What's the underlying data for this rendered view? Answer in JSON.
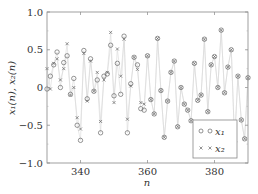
{
  "chart_data": {
    "type": "scatter",
    "title": "",
    "xlabel": "n",
    "ylabel": "x_1(n), x_2(n)",
    "xlim": [
      330,
      390
    ],
    "ylim": [
      -1.0,
      1.0
    ],
    "xticks": [
      340,
      360,
      380
    ],
    "xtick_labels": [
      "340",
      "360",
      "380"
    ],
    "yticks": [
      -1.0,
      -0.5,
      0,
      0.5,
      1.0
    ],
    "ytick_labels": [
      "−1.0",
      "−0.5",
      "0",
      "0.5",
      "1.0"
    ],
    "grid": false,
    "legend_position": "lower right",
    "connecting_lines": true,
    "x": [
      330,
      331,
      332,
      333,
      334,
      335,
      336,
      337,
      338,
      339,
      340,
      341,
      342,
      343,
      344,
      345,
      346,
      347,
      348,
      349,
      350,
      351,
      352,
      353,
      354,
      355,
      356,
      357,
      358,
      359,
      360,
      361,
      362,
      363,
      364,
      365,
      366,
      367,
      368,
      369,
      370,
      371,
      372,
      373,
      374,
      375,
      376,
      377,
      378,
      379,
      380,
      381,
      382,
      383,
      384,
      385,
      386,
      387,
      388,
      389,
      390
    ],
    "series": [
      {
        "name": "x_1",
        "marker": "circle",
        "values": [
          -0.02,
          0.15,
          0.3,
          0.47,
          0.0,
          0.33,
          0.42,
          -0.09,
          0.12,
          -0.5,
          -0.7,
          0.49,
          -0.15,
          0.38,
          -0.05,
          0.1,
          -0.6,
          0.15,
          0.18,
          0.56,
          -0.11,
          0.32,
          -0.09,
          0.68,
          -0.6,
          0.05,
          0.4,
          0.3,
          -0.28,
          -0.3,
          0.42,
          -0.16,
          -0.35,
          0.65,
          -0.04,
          -0.66,
          -0.18,
          0.2,
          0.35,
          -0.52,
          0.0,
          -0.22,
          -0.3,
          -0.44,
          0.32,
          -0.17,
          -0.1,
          0.64,
          -0.32,
          0.3,
          0.41,
          0.0,
          0.76,
          -0.07,
          0.27,
          0.5,
          -0.72,
          0.15,
          -0.43,
          -0.68,
          0.13
        ]
      },
      {
        "name": "x_2",
        "marker": "cross",
        "values": [
          0.25,
          -0.02,
          0.32,
          0.38,
          0.1,
          0.25,
          0.58,
          -0.1,
          0.0,
          -0.4,
          -0.55,
          0.45,
          -0.18,
          0.35,
          -0.05,
          0.2,
          -0.45,
          0.1,
          0.2,
          0.73,
          -0.2,
          0.51,
          0.15,
          0.64,
          -0.42,
          0.02,
          0.4,
          0.24,
          -0.2,
          -0.22,
          0.42,
          -0.16,
          -0.35,
          0.65,
          -0.04,
          -0.66,
          -0.18,
          0.2,
          0.35,
          -0.52,
          0.0,
          -0.22,
          -0.3,
          -0.44,
          0.32,
          -0.17,
          -0.1,
          0.64,
          -0.32,
          0.3,
          0.41,
          0.0,
          0.76,
          -0.07,
          0.27,
          0.5,
          -0.72,
          0.15,
          -0.43,
          -0.68,
          0.13
        ]
      }
    ],
    "legend": [
      {
        "label": "x_1",
        "marker": "circle"
      },
      {
        "label": "x_2",
        "marker": "cross"
      }
    ]
  },
  "labels": {
    "xlabel": "n",
    "ylabel": "x₁(n), x₂(n)",
    "legend_x1": "x₁",
    "legend_x2": "x₂"
  },
  "colors": {
    "axes": "#888888",
    "marker": "#666666",
    "line": "#d8d8d8",
    "text": "#333333"
  }
}
